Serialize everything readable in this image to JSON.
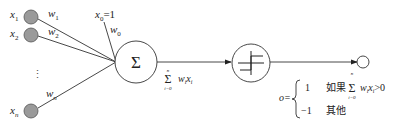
{
  "diagram": {
    "inputs": [
      {
        "label": "x",
        "sub": "1",
        "weight": "w",
        "weight_sub": "1"
      },
      {
        "label": "x",
        "sub": "2",
        "weight": "w",
        "weight_sub": "2"
      },
      {
        "label": "x",
        "sub": "n",
        "weight": "w",
        "weight_sub": "n"
      }
    ],
    "bias": {
      "label": "x",
      "sub": "0",
      "value": "=1",
      "weight": "w",
      "weight_sub": "0"
    },
    "ellipsis": "⋮",
    "sum_node": {
      "symbol": "Σ"
    },
    "sum_output": {
      "sigma": "Σ",
      "upper": "n",
      "lower": "i=0",
      "term_w": "w",
      "term_w_sub": "i",
      "term_x": "x",
      "term_x_sub": "i"
    },
    "activation_node": {
      "type": "step-function"
    },
    "output_formula": {
      "lhs": "o=",
      "case1_value": "1",
      "case1_condition_prefix": "如果",
      "case1_sigma": "Σ",
      "case1_upper": "n",
      "case1_lower": "i=0",
      "case1_term": "w",
      "case1_term_sub": "i",
      "case1_term2": "x",
      "case1_term2_sub": "i",
      "case1_cmp": ">0",
      "case2_value": "−1",
      "case2_condition": "其他"
    },
    "colors": {
      "input_fill": "#999999",
      "stroke": "#333333"
    }
  }
}
